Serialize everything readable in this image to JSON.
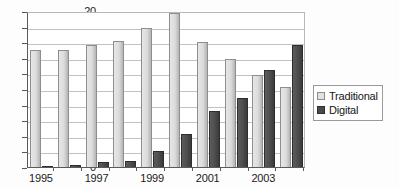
{
  "chart_data": {
    "type": "bar",
    "title": "",
    "subtitle": "",
    "xlabel": "",
    "ylabel": "",
    "categories": [
      "1995",
      "1996",
      "1997",
      "1998",
      "1999",
      "2000",
      "2001",
      "2002",
      "2003",
      "2004"
    ],
    "visible_tick_labels": [
      "1995",
      "1997",
      "1999",
      "2001",
      "2003"
    ],
    "series": [
      {
        "name": "Traditional",
        "color": "#dcdcdc",
        "values": [
          15.0,
          15.0,
          15.7,
          16.1,
          17.8,
          19.7,
          16.0,
          13.9,
          11.8,
          10.2
        ]
      },
      {
        "name": "Digital",
        "color": "#4a4a4a",
        "values": [
          0.1,
          0.2,
          0.6,
          0.8,
          2.0,
          4.2,
          7.2,
          8.9,
          12.4,
          15.6
        ]
      }
    ],
    "ylim": [
      0,
      20
    ],
    "yticks": [
      0,
      2,
      4,
      6,
      8,
      10,
      12,
      14,
      16,
      18,
      20
    ],
    "ytick_labels": [
      "0",
      "2",
      "4",
      "6",
      "8",
      "10",
      "12",
      "14",
      "16",
      "18",
      "20"
    ],
    "grid": true,
    "grid_axis": "y",
    "legend_position": "right",
    "legend_entries": [
      "Traditional",
      "Digital"
    ]
  }
}
